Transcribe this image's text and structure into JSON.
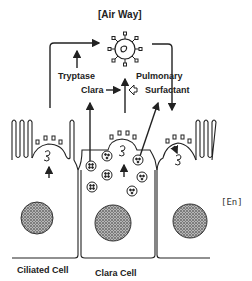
{
  "diagram": {
    "title": "[Air Way]",
    "labels": {
      "tryptase": "Tryptase",
      "clara": "Clara",
      "pulmonary": "Pulmonary",
      "surfactant": "Surfactant",
      "en": "[En]",
      "ciliated_cell": "Ciliated Cell",
      "clara_cell": "Clara Cell"
    },
    "colors": {
      "line": "#222222",
      "nucleus": "#555555",
      "background": "#ffffff"
    }
  }
}
